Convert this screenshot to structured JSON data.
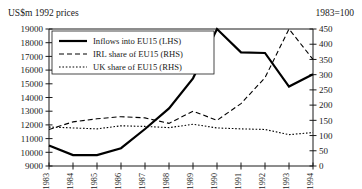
{
  "header": {
    "left_label": "US$m 1992 prices",
    "right_label": "1983=100"
  },
  "legend": {
    "items": [
      {
        "label": "Inflows into EU15 (LHS)",
        "style": "solid"
      },
      {
        "label": "IRL share of EU15 (RHS)",
        "style": "dashed"
      },
      {
        "label": "UK share of EU15 (RHS)",
        "style": "dotted"
      }
    ]
  },
  "chart_data": {
    "type": "line",
    "title": "",
    "xlabel": "",
    "ylabel": "US$m 1992 prices",
    "y2label": "1983=100",
    "grid": false,
    "legend_position": "top-left",
    "categories": [
      "1983",
      "1984",
      "1985",
      "1986",
      "1987",
      "1988",
      "1989",
      "1990",
      "1991",
      "1992",
      "1993",
      "1994"
    ],
    "x_tick_labels": [
      "1983",
      "1984",
      "1985",
      "1986",
      "1987",
      "1988",
      "1989",
      "1990",
      "1991",
      "1992",
      "1993",
      "1994"
    ],
    "ylim": [
      9000,
      19000
    ],
    "y_ticks": [
      9000,
      10000,
      11000,
      12000,
      13000,
      14000,
      15000,
      16000,
      17000,
      18000,
      19000
    ],
    "y_tick_labels": [
      "9000",
      "10000",
      "11000",
      "12000",
      "13000",
      "14000",
      "15000",
      "16000",
      "17000",
      "18000",
      "19000"
    ],
    "y2lim": [
      0,
      450
    ],
    "y2_ticks": [
      0,
      50,
      100,
      150,
      200,
      250,
      300,
      350,
      400,
      450
    ],
    "y2_tick_labels": [
      "0",
      "50",
      "100",
      "150",
      "200",
      "250",
      "300",
      "350",
      "400",
      "450"
    ],
    "series": [
      {
        "name": "Inflows into EU15 (LHS)",
        "axis": "left",
        "style": "solid",
        "width": 2.2,
        "values": [
          10500,
          9800,
          9800,
          10300,
          11700,
          13200,
          15400,
          19000,
          17300,
          17250,
          14800,
          15700
        ]
      },
      {
        "name": "IRL share of EU15 (RHS)",
        "axis": "right",
        "style": "dashed",
        "width": 1.1,
        "values": [
          120,
          145,
          155,
          162,
          158,
          140,
          180,
          150,
          205,
          290,
          450,
          350
        ]
      },
      {
        "name": "UK share of EU15 (RHS)",
        "axis": "right",
        "style": "dotted",
        "width": 1.1,
        "values": [
          128,
          125,
          122,
          132,
          130,
          126,
          137,
          125,
          122,
          120,
          103,
          110
        ]
      }
    ]
  }
}
